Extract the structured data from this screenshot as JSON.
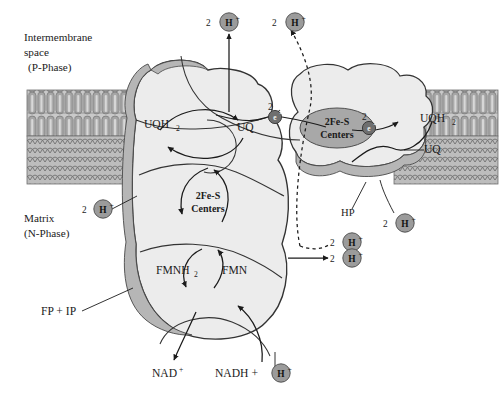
{
  "figure": {
    "type": "biochemical-pathway-diagram"
  },
  "colors": {
    "membrane_head": "#a9a9a9",
    "membrane_tail": "#cfcfcf",
    "membrane_hatch": "#b3b3b3",
    "protein_fill": "#ececec",
    "protein_rim": "#b8b8b8",
    "protein_stroke": "#333333",
    "fes_ellipse": "#a8a8a8",
    "proton_circle": "#9b9b9b",
    "electron_circle": "#6f6f6f",
    "line": "#1b1b1b",
    "text": "#1b1b1b",
    "background": "#ffffff"
  },
  "compartments": {
    "top": {
      "line1": "Intermembrane",
      "line2": "space",
      "line3": "(P-Phase)"
    },
    "bottom": {
      "line1": "Matrix",
      "line2": "(N-Phase)"
    }
  },
  "subunit_labels": {
    "fp_ip": "FP + IP",
    "hp": "HP"
  },
  "cofactors": {
    "fes_upper": {
      "line1": "2Fe-S",
      "line2": "Centers"
    },
    "fes_lower": {
      "line1": "2Fe-S",
      "line2": "Centers"
    },
    "fmnh2": {
      "base": "FMNH",
      "sub": "2"
    },
    "fmn": "FMN"
  },
  "quinones": {
    "uqh2_left": {
      "base": "UQH",
      "sub": "2"
    },
    "uq_center": "UQ",
    "uqh2_right": {
      "base": "UQH",
      "sub": "2"
    },
    "uq_right": "UQ"
  },
  "substrates": {
    "nad_plus": {
      "base": "NAD",
      "sup": "+"
    },
    "nadh": "NADH +"
  },
  "protons": [
    {
      "id": "h-top-left",
      "count": "2",
      "label": "H",
      "charge": "+"
    },
    {
      "id": "h-top-right",
      "count": "2",
      "label": "H",
      "charge": "+"
    },
    {
      "id": "h-matrix-left",
      "count": "2",
      "label": "H",
      "charge": "+"
    },
    {
      "id": "h-matrix-dashed",
      "count": "2",
      "label": "H",
      "charge": "+"
    },
    {
      "id": "h-matrix-solid",
      "count": "2",
      "label": "H",
      "charge": "+"
    },
    {
      "id": "h-matrix-hp",
      "count": "2",
      "label": "H",
      "charge": "+"
    },
    {
      "id": "h-nadh",
      "count": "",
      "label": "H",
      "charge": "+"
    }
  ],
  "electrons": [
    {
      "id": "e-left",
      "count": "2",
      "glyph": "e",
      "charge": "-"
    },
    {
      "id": "e-right",
      "count": "2",
      "glyph": "e",
      "charge": "-"
    }
  ]
}
